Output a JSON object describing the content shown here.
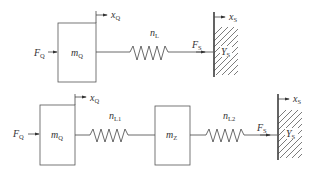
{
  "diagram": {
    "top": {
      "mass": {
        "symbol": "m",
        "sub": "Q"
      },
      "force_left": {
        "symbol": "F",
        "sub": "Q"
      },
      "displacement_mass": {
        "symbol": "x",
        "sub": "Q"
      },
      "spring": {
        "symbol": "n",
        "sub": "L"
      },
      "force_right": {
        "symbol": "F",
        "sub": "S"
      },
      "displacement_wall": {
        "symbol": "x",
        "sub": "S"
      },
      "wall_admittance": {
        "symbol": "Y",
        "sub": "S"
      }
    },
    "bottom": {
      "mass1": {
        "symbol": "m",
        "sub": "Q"
      },
      "force_left": {
        "symbol": "F",
        "sub": "Q"
      },
      "displacement_mass": {
        "symbol": "x",
        "sub": "Q"
      },
      "spring1": {
        "symbol": "n",
        "sub": "L1"
      },
      "mass2": {
        "symbol": "m",
        "sub": "Z"
      },
      "spring2": {
        "symbol": "n",
        "sub": "L2"
      },
      "force_right": {
        "symbol": "F",
        "sub": "S"
      },
      "displacement_wall": {
        "symbol": "x",
        "sub": "S"
      },
      "wall_admittance": {
        "symbol": "Y",
        "sub": "S"
      }
    }
  }
}
